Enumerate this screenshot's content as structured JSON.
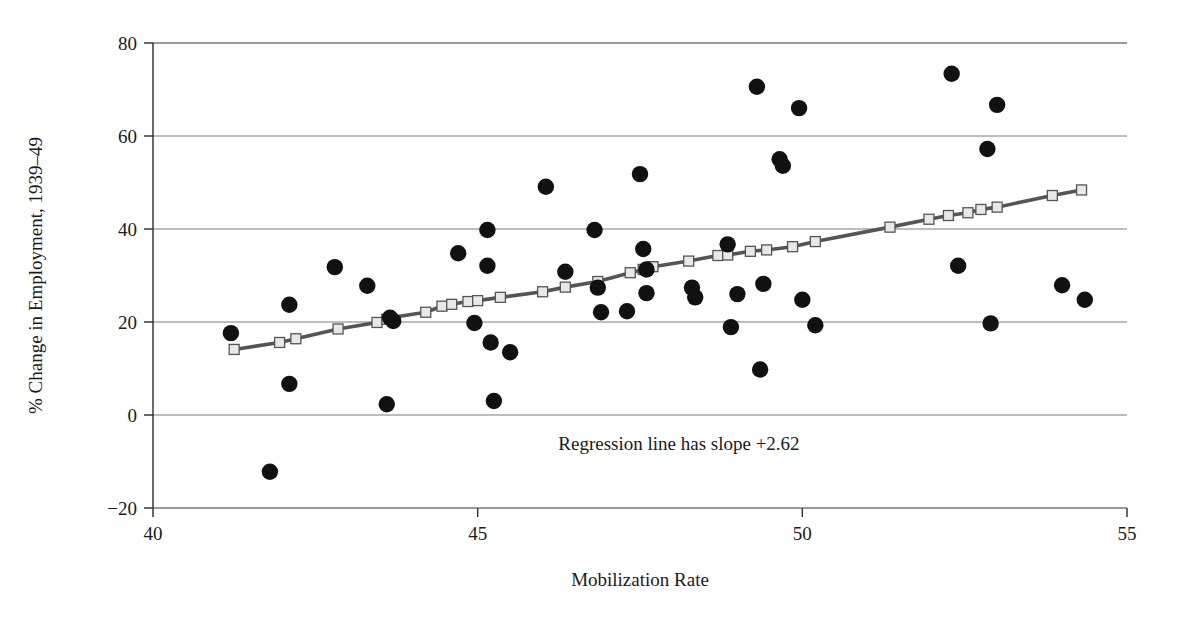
{
  "chart_data": {
    "type": "scatter",
    "title": "",
    "xlabel": "Mobilization Rate",
    "ylabel": "% Change in Employment, 1939–49",
    "xlim": [
      40,
      55
    ],
    "ylim": [
      -20,
      80
    ],
    "xticks": [
      40,
      45,
      50,
      55
    ],
    "yticks": [
      -20,
      0,
      20,
      40,
      60,
      80
    ],
    "xtick_labels": [
      "40",
      "45",
      "50",
      "55"
    ],
    "ytick_labels": [
      "-20",
      "0",
      "20",
      "40",
      "60",
      "80"
    ],
    "grid": "horizontal",
    "legend": "none",
    "annotations": [
      {
        "text": "Regression line has slope +2.62",
        "x": 48.1,
        "y": -7.5
      }
    ],
    "series": [
      {
        "name": "observations",
        "type": "scatter",
        "marker": "filled-circle",
        "color": "#111111",
        "points": [
          [
            41.2,
            17.6
          ],
          [
            41.8,
            -12.2
          ],
          [
            42.1,
            23.7
          ],
          [
            42.1,
            6.7
          ],
          [
            42.8,
            31.8
          ],
          [
            43.3,
            27.8
          ],
          [
            43.6,
            2.3
          ],
          [
            43.65,
            20.9
          ],
          [
            43.7,
            20.2
          ],
          [
            44.7,
            34.8
          ],
          [
            44.95,
            19.8
          ],
          [
            45.15,
            32.1
          ],
          [
            45.15,
            39.8
          ],
          [
            45.2,
            15.6
          ],
          [
            45.25,
            3.0
          ],
          [
            45.5,
            13.5
          ],
          [
            46.05,
            49.1
          ],
          [
            46.35,
            30.8
          ],
          [
            46.8,
            39.8
          ],
          [
            46.85,
            27.4
          ],
          [
            46.9,
            22.1
          ],
          [
            47.3,
            22.3
          ],
          [
            47.5,
            51.8
          ],
          [
            47.55,
            35.7
          ],
          [
            47.6,
            31.3
          ],
          [
            47.6,
            26.2
          ],
          [
            48.3,
            27.4
          ],
          [
            48.35,
            25.3
          ],
          [
            48.85,
            36.7
          ],
          [
            48.9,
            18.9
          ],
          [
            49.0,
            26.0
          ],
          [
            49.3,
            70.6
          ],
          [
            49.35,
            9.8
          ],
          [
            49.4,
            28.2
          ],
          [
            49.65,
            55.0
          ],
          [
            49.7,
            53.6
          ],
          [
            49.95,
            66.0
          ],
          [
            50.0,
            24.8
          ],
          [
            50.2,
            19.3
          ],
          [
            52.3,
            73.4
          ],
          [
            52.4,
            32.1
          ],
          [
            52.85,
            57.2
          ],
          [
            52.9,
            19.7
          ],
          [
            53.0,
            66.7
          ],
          [
            54.0,
            27.9
          ],
          [
            54.35,
            24.8
          ]
        ]
      },
      {
        "name": "regression line",
        "type": "line",
        "marker": "open-square",
        "color": "#555555",
        "marker_fill": "#e8e8e8",
        "slope": 2.62,
        "points": [
          [
            41.25,
            14.1
          ],
          [
            41.95,
            15.6
          ],
          [
            42.2,
            16.4
          ],
          [
            42.85,
            18.5
          ],
          [
            43.45,
            19.9
          ],
          [
            43.6,
            20.6
          ],
          [
            43.65,
            20.9
          ],
          [
            44.2,
            22.1
          ],
          [
            44.45,
            23.4
          ],
          [
            44.6,
            23.8
          ],
          [
            44.85,
            24.4
          ],
          [
            45.0,
            24.6
          ],
          [
            45.35,
            25.3
          ],
          [
            46.0,
            26.5
          ],
          [
            46.35,
            27.5
          ],
          [
            46.85,
            28.7
          ],
          [
            47.35,
            30.6
          ],
          [
            47.55,
            31.3
          ],
          [
            47.7,
            31.9
          ],
          [
            48.25,
            33.1
          ],
          [
            48.7,
            34.3
          ],
          [
            48.85,
            34.4
          ],
          [
            49.2,
            35.2
          ],
          [
            49.45,
            35.5
          ],
          [
            49.85,
            36.2
          ],
          [
            50.2,
            37.3
          ],
          [
            51.35,
            40.4
          ],
          [
            51.95,
            42.1
          ],
          [
            52.25,
            42.9
          ],
          [
            52.55,
            43.5
          ],
          [
            52.75,
            44.2
          ],
          [
            53.0,
            44.7
          ],
          [
            53.85,
            47.2
          ],
          [
            54.3,
            48.4
          ]
        ]
      }
    ]
  },
  "axes": {
    "x_title": "Mobilization Rate",
    "y_title": "% Change in Employment, 1939–49"
  },
  "annotation": {
    "regression_note": "Regression line has slope +2.62"
  },
  "colors": {
    "point": "#111111",
    "line": "#555555",
    "marker_fill": "#e8e8e8",
    "grid": "#7a7a7a",
    "axis": "#2a2a2a",
    "background": "#ffffff"
  }
}
